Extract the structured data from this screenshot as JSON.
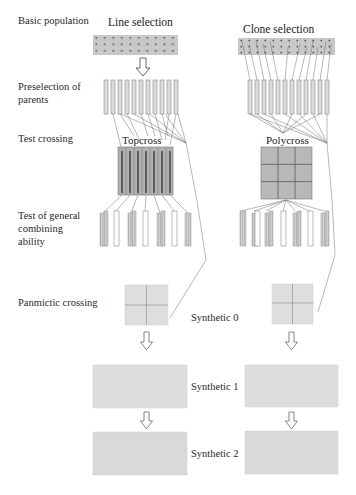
{
  "stage_labels": {
    "basic_population": "Basic population",
    "preselection_line1": "Preselection of",
    "preselection_line2": "parents",
    "test_crossing": "Test crossing",
    "gca_line1": "Test of general",
    "gca_line2": "combining",
    "gca_line3": "ability",
    "panmictic_crossing": "Panmictic crossing"
  },
  "branches": {
    "left": {
      "title": "Line selection",
      "cross_type": "Topcross"
    },
    "right": {
      "title": "Clone selection",
      "cross_type": "Polycross"
    }
  },
  "generations": {
    "syn0": "Synthetic 0",
    "syn1": "Synthetic 1",
    "syn2": "Synthetic 2"
  },
  "colors": {
    "population_fill": "#c8c8c8",
    "dot": "#555555",
    "bar_fill": "#d9d9d9",
    "bar_stroke": "#8a8a8a",
    "grid_fill": "#b4b4b4",
    "grid_line": "#5a5a5a",
    "panmictic_fill": "#dedede",
    "synthetic_fill": "#dcdcdc",
    "connector": "#6a6a6a"
  },
  "caption_fragment": "(caption text below figure, cut off)"
}
